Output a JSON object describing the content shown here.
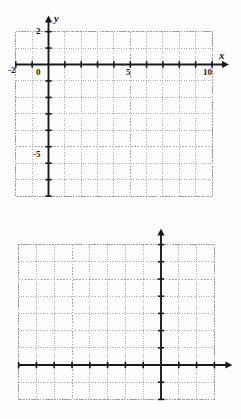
{
  "page": {
    "background": "#fefefe",
    "axis_color": "#1a1a1a",
    "grid_color": "#9a9a9a"
  },
  "chart_data": [
    {
      "id": "top-grid",
      "type": "scatter",
      "title": "",
      "xlabel": "x",
      "ylabel": "y",
      "xlim": [
        -2,
        10
      ],
      "ylim": [
        -8,
        2
      ],
      "xticks": [
        -2,
        -1,
        0,
        1,
        2,
        3,
        4,
        5,
        6,
        7,
        8,
        9,
        10
      ],
      "yticks": [
        2,
        1,
        0,
        -1,
        -2,
        -3,
        -4,
        -5,
        -6,
        -7,
        -8
      ],
      "xtick_labels": [
        {
          "value": -2,
          "text": "-2"
        },
        {
          "value": 0,
          "text": "0"
        },
        {
          "value": 5,
          "text": "5"
        },
        {
          "value": 10,
          "text": "10"
        }
      ],
      "ytick_labels": [
        {
          "value": 2,
          "text": "2"
        },
        {
          "value": -5,
          "text": "-5"
        }
      ],
      "grid": true,
      "grid_style": "dotted",
      "series": [],
      "values": [],
      "legend": "none"
    },
    {
      "id": "bottom-grid",
      "type": "scatter",
      "title": "",
      "xlabel": "x",
      "ylabel": "y",
      "xlim": [
        -8,
        3
      ],
      "ylim": [
        -2,
        7
      ],
      "xticks": [
        -8,
        -7,
        -6,
        -5,
        -4,
        -3,
        -2,
        -1,
        0,
        1,
        2,
        3
      ],
      "yticks": [
        7,
        6,
        5,
        4,
        3,
        2,
        1,
        0,
        -1,
        -2
      ],
      "xtick_labels": [
        {
          "value": -5,
          "text": "-5"
        },
        {
          "value": 0,
          "text": "0"
        },
        {
          "value": 3,
          "text": "3"
        }
      ],
      "ytick_labels": [
        {
          "value": 5,
          "text": "5"
        },
        {
          "value": -2,
          "text": "-2"
        }
      ],
      "grid": true,
      "grid_style": "dotted",
      "series": [],
      "values": [],
      "legend": "none"
    }
  ],
  "top_graph": {
    "axis_label_x": "x",
    "axis_label_y": "y",
    "label_y_top": "2",
    "label_x_left": "-2",
    "label_origin": "0",
    "label_x_five": "5",
    "label_x_ten": "10",
    "label_y_negfive": "-5"
  },
  "bottom_graph": {
    "axis_label_x": "x",
    "axis_label_y": "y",
    "label_y_five": "5",
    "label_x_negfive": "-5",
    "label_origin": "0",
    "label_x_three": "3",
    "label_y_negtwo": "-2"
  }
}
